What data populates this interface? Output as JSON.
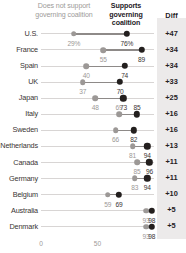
{
  "legend": {
    "left_label": "Does not support governing coalition",
    "right_label": "Supports governing coalition",
    "diff_header": "Diff"
  },
  "colors": {
    "low_dot": "#9c9896",
    "high_dot": "#231f1e",
    "connector": "#8e8a88",
    "axis": "#d8d5d4",
    "diff_panel": "#eceaea"
  },
  "chart_data": {
    "type": "scatter",
    "title": "",
    "subtitle": "",
    "xlabel": "",
    "ylabel": "",
    "xlim": [
      0,
      100
    ],
    "xticks": [
      "0",
      "50"
    ],
    "xtick_values": [
      0,
      50
    ],
    "grid": false,
    "legend_position": "top",
    "categories": [
      "U.S.",
      "France",
      "Spain",
      "UK",
      "Japan",
      "Italy",
      "Sweden",
      "Netherlands",
      "Canada",
      "Germany",
      "Belgium",
      "Australia",
      "Denmark"
    ],
    "series": [
      {
        "name": "Does not support governing coalition",
        "values": [
          29,
          55,
          40,
          37,
          48,
          69,
          66,
          81,
          85,
          83,
          59,
          93,
          93
        ],
        "labels": [
          "29%",
          "55",
          "40",
          "37",
          "48",
          "69",
          "66",
          "81",
          "85",
          "83",
          "59",
          "93",
          "93"
        ]
      },
      {
        "name": "Supports governing coalition",
        "values": [
          76,
          89,
          74,
          70,
          73,
          85,
          82,
          94,
          96,
          94,
          69,
          98,
          98
        ],
        "labels": [
          "76%",
          "89",
          "74",
          "70",
          "73",
          "85",
          "82",
          "94",
          "96",
          "94",
          "69",
          "98",
          "98"
        ]
      }
    ],
    "diff": [
      "+47",
      "+34",
      "+34",
      "+33",
      "+25",
      "+16",
      "+16",
      "+13",
      "+11",
      "+11",
      "+10",
      "+5",
      "+5"
    ],
    "label_placement": [
      "below",
      "below",
      "below",
      "below",
      "below",
      "above",
      "below",
      "below",
      "below",
      "below",
      "below",
      "below",
      "below"
    ]
  }
}
